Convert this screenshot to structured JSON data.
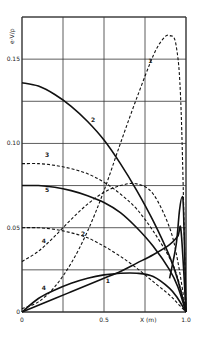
{
  "chart_data": {
    "type": "line",
    "title": "",
    "xlabel": "X (m)",
    "ylabel": "e·V/ρ",
    "xlim": [
      0,
      1.0
    ],
    "ylim": [
      0,
      0.175
    ],
    "grid": true,
    "x_ticks": [
      "0",
      "0.5",
      "1.0"
    ],
    "y_ticks": [
      "0",
      "0.05",
      "0.10",
      "0.15"
    ],
    "series": [
      {
        "name": "2 (solid)",
        "style": "solid",
        "label": "2",
        "x": [
          0,
          0.1,
          0.2,
          0.3,
          0.4,
          0.5,
          0.6,
          0.7,
          0.8,
          0.9,
          0.95,
          1.0
        ],
        "y": [
          0.136,
          0.134,
          0.129,
          0.122,
          0.113,
          0.102,
          0.088,
          0.072,
          0.054,
          0.033,
          0.019,
          0.0
        ]
      },
      {
        "name": "1 (dashed)",
        "style": "dashed",
        "label": "1",
        "x": [
          0,
          0.1,
          0.2,
          0.3,
          0.4,
          0.5,
          0.6,
          0.7,
          0.8,
          0.86,
          0.9,
          0.94,
          0.97,
          1.0
        ],
        "y": [
          0.002,
          0.006,
          0.015,
          0.029,
          0.048,
          0.072,
          0.1,
          0.127,
          0.152,
          0.162,
          0.164,
          0.158,
          0.12,
          0.0
        ]
      },
      {
        "name": "3 (dashed)",
        "style": "dashed",
        "label": "3",
        "x": [
          0,
          0.1,
          0.2,
          0.3,
          0.4,
          0.5,
          0.6,
          0.7,
          0.8,
          0.9,
          0.95,
          1.0
        ],
        "y": [
          0.088,
          0.088,
          0.087,
          0.085,
          0.082,
          0.077,
          0.07,
          0.061,
          0.048,
          0.032,
          0.02,
          0.0
        ]
      },
      {
        "name": "5 (solid)",
        "style": "solid",
        "label": "5",
        "x": [
          0,
          0.1,
          0.2,
          0.3,
          0.4,
          0.5,
          0.6,
          0.7,
          0.8,
          0.9,
          0.95,
          1.0
        ],
        "y": [
          0.075,
          0.075,
          0.074,
          0.072,
          0.069,
          0.065,
          0.059,
          0.05,
          0.039,
          0.025,
          0.015,
          0.0
        ]
      },
      {
        "name": "4 (dashed)",
        "style": "dashed",
        "label": "4",
        "x": [
          0,
          0.1,
          0.2,
          0.3,
          0.4,
          0.5,
          0.6,
          0.7,
          0.8,
          0.9,
          0.95,
          1.0
        ],
        "y": [
          0.03,
          0.036,
          0.045,
          0.055,
          0.064,
          0.071,
          0.075,
          0.076,
          0.07,
          0.05,
          0.03,
          0.0
        ]
      },
      {
        "name": "2 (dashed)",
        "style": "dashed",
        "label": "2",
        "x": [
          0,
          0.1,
          0.2,
          0.3,
          0.4,
          0.5,
          0.6,
          0.7,
          0.8,
          0.9,
          0.95,
          1.0
        ],
        "y": [
          0.05,
          0.05,
          0.049,
          0.047,
          0.044,
          0.039,
          0.033,
          0.026,
          0.018,
          0.01,
          0.005,
          0.0
        ]
      },
      {
        "name": "4 (solid)",
        "style": "solid",
        "label": "4",
        "x": [
          0,
          0.1,
          0.2,
          0.3,
          0.4,
          0.5,
          0.6,
          0.7,
          0.8,
          0.9,
          0.95,
          0.97,
          1.0
        ],
        "y": [
          0.0,
          0.004,
          0.008,
          0.012,
          0.016,
          0.02,
          0.024,
          0.029,
          0.034,
          0.04,
          0.045,
          0.048,
          0.0
        ]
      },
      {
        "name": "1 (solid)",
        "style": "solid",
        "label": "1",
        "x": [
          0,
          0.1,
          0.2,
          0.3,
          0.4,
          0.5,
          0.6,
          0.7,
          0.8,
          0.9,
          0.95,
          1.0
        ],
        "y": [
          0.0,
          0.008,
          0.013,
          0.017,
          0.02,
          0.022,
          0.023,
          0.023,
          0.021,
          0.014,
          0.008,
          0.0
        ]
      },
      {
        "name": "spike (solid)",
        "style": "solid",
        "label": "",
        "x": [
          0.9,
          0.94,
          0.96,
          0.975,
          0.985,
          1.0
        ],
        "y": [
          0.02,
          0.04,
          0.06,
          0.068,
          0.06,
          0.0
        ]
      }
    ],
    "annotations": [
      {
        "text": "2",
        "x": 0.42,
        "y": 0.113
      },
      {
        "text": "1",
        "x": 0.77,
        "y": 0.148
      },
      {
        "text": "3",
        "x": 0.14,
        "y": 0.092
      },
      {
        "text": "5",
        "x": 0.14,
        "y": 0.071
      },
      {
        "text": "4",
        "x": 0.12,
        "y": 0.041
      },
      {
        "text": "2",
        "x": 0.36,
        "y": 0.045
      },
      {
        "text": "4",
        "x": 0.12,
        "y": 0.013
      },
      {
        "text": "1",
        "x": 0.51,
        "y": 0.017
      }
    ]
  }
}
